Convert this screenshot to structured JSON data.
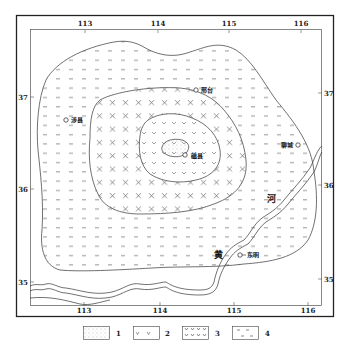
{
  "map": {
    "frame": {
      "outer": [
        16,
        16,
        334,
        316
      ],
      "inner": [
        30,
        30,
        322,
        306
      ]
    },
    "top_ticks": [
      {
        "label": "113",
        "x": 85
      },
      {
        "label": "114",
        "x": 158
      },
      {
        "label": "115",
        "x": 229
      },
      {
        "label": "116",
        "x": 301
      }
    ],
    "bottom_ticks": [
      {
        "label": "113",
        "x": 84
      },
      {
        "label": "114",
        "x": 160
      },
      {
        "label": "115",
        "x": 234
      },
      {
        "label": "116",
        "x": 308
      }
    ],
    "left_ticks": [
      {
        "label": "37",
        "y": 97
      },
      {
        "label": "36",
        "y": 189
      },
      {
        "label": "35",
        "y": 282
      }
    ],
    "right_ticks": [
      {
        "label": "37",
        "y": 93
      },
      {
        "label": "36",
        "y": 185
      },
      {
        "label": "35",
        "y": 279
      }
    ],
    "places": [
      {
        "name": "涉县",
        "x": 66,
        "y": 120
      },
      {
        "name": "邢台",
        "x": 196,
        "y": 90
      },
      {
        "name": "磁县",
        "x": 185,
        "y": 155
      },
      {
        "name": "聊城",
        "x": 298,
        "y": 145
      },
      {
        "name": "东明",
        "x": 240,
        "y": 255
      }
    ],
    "river_labels": [
      {
        "text": "黄",
        "x": 218,
        "y": 258
      },
      {
        "text": "河",
        "x": 271,
        "y": 202
      }
    ],
    "legend": [
      {
        "id": "1",
        "pattern": "dots"
      },
      {
        "id": "2",
        "pattern": "v-marks"
      },
      {
        "id": "3",
        "pattern": "x-marks"
      },
      {
        "id": "4",
        "pattern": "dashes"
      }
    ],
    "colors": {
      "line": "#333333",
      "fill": "#ffffff",
      "symbol": "#666666"
    }
  }
}
